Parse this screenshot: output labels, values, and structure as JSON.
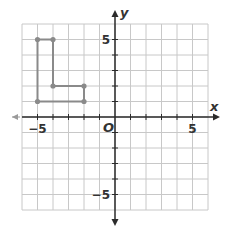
{
  "chart_data": {
    "type": "scatter",
    "title": "",
    "xlabel": "x",
    "ylabel": "y",
    "xlim": [
      -6,
      6
    ],
    "ylim": [
      -6,
      6
    ],
    "grid": true,
    "grid_step": 1,
    "tick_labels": {
      "x": [
        {
          "value": -5,
          "label": "−5"
        },
        {
          "value": 5,
          "label": "5"
        }
      ],
      "y": [
        {
          "value": 5,
          "label": "5"
        },
        {
          "value": -5,
          "label": "−5"
        }
      ]
    },
    "origin_label": "O",
    "shapes": [
      {
        "name": "L-shaped polygon",
        "closed": true,
        "vertices": [
          [
            -5,
            5
          ],
          [
            -4,
            5
          ],
          [
            -4,
            2
          ],
          [
            -2,
            2
          ],
          [
            -2,
            1
          ],
          [
            -5,
            1
          ]
        ]
      }
    ]
  },
  "colors": {
    "grid": "#c8c8c8",
    "axis": "#2b2b2b",
    "shape": "#8a8a8a",
    "negative_x_arrow": "#9a9a9a"
  }
}
